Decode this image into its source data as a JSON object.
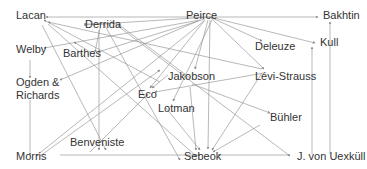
{
  "diagram": {
    "type": "directed-graph",
    "colors": {
      "edge": "#9a9a9a",
      "text": "#333333",
      "background": "#ffffff"
    },
    "nodes": [
      {
        "id": "lacan",
        "label": "Lacan",
        "x": 16,
        "y": 19,
        "ax": 46,
        "ay": 17
      },
      {
        "id": "derrida",
        "label": "Derrida",
        "x": 85,
        "y": 28,
        "ax": 84,
        "ay": 25
      },
      {
        "id": "peirce",
        "label": "Peirce",
        "x": 186,
        "y": 19,
        "ax": 210,
        "ay": 17
      },
      {
        "id": "bakhtin",
        "label": "Bakhtin",
        "x": 323,
        "y": 19,
        "ax": 320,
        "ay": 17
      },
      {
        "id": "welby",
        "label": "Welby",
        "x": 16,
        "y": 53,
        "ax": 44,
        "ay": 50
      },
      {
        "id": "barthes",
        "label": "Barthes",
        "x": 63,
        "y": 57,
        "ax": 98,
        "ay": 58
      },
      {
        "id": "deleuze",
        "label": "Deleuze",
        "x": 255,
        "y": 50,
        "ax": 262,
        "ay": 41
      },
      {
        "id": "kull",
        "label": "Kull",
        "x": 320,
        "y": 46,
        "ax": 317,
        "ay": 43
      },
      {
        "id": "ogden",
        "label": "Ogden &",
        "label2": "Richards",
        "x": 16,
        "y": 86,
        "ax": 60,
        "ay": 82
      },
      {
        "id": "jakobson",
        "label": "Jakobson",
        "x": 168,
        "y": 80,
        "ax": 195,
        "ay": 70
      },
      {
        "id": "levistrauss",
        "label": "Lévi-Strauss",
        "x": 255,
        "y": 80,
        "ax": 264,
        "ay": 70
      },
      {
        "id": "eco",
        "label": "Eco",
        "x": 138,
        "y": 98,
        "ax": 150,
        "ay": 90
      },
      {
        "id": "lotman",
        "label": "Lotman",
        "x": 158,
        "y": 112,
        "ax": 173,
        "ay": 102
      },
      {
        "id": "buhler",
        "label": "Bühler",
        "x": 270,
        "y": 121,
        "ax": 270,
        "ay": 113
      },
      {
        "id": "benveniste",
        "label": "Benveniste",
        "x": 70,
        "y": 146,
        "ax": 84,
        "ay": 137
      },
      {
        "id": "morris",
        "label": "Morris",
        "x": 16,
        "y": 160,
        "ax": 44,
        "ay": 157
      },
      {
        "id": "sebeok",
        "label": "Sebeok",
        "x": 184,
        "y": 160,
        "ax": 205,
        "ay": 150
      },
      {
        "id": "uexkull",
        "label": "J. von Uexküll",
        "x": 297,
        "y": 160,
        "ax": 295,
        "ay": 157
      }
    ],
    "edges": [
      {
        "from": [
          210,
          17
        ],
        "to": [
          46,
          17
        ]
      },
      {
        "from": [
          210,
          17
        ],
        "to": [
          84,
          25
        ]
      },
      {
        "from": [
          210,
          17
        ],
        "to": [
          318,
          17
        ]
      },
      {
        "from": [
          210,
          17
        ],
        "to": [
          315,
          43
        ]
      },
      {
        "from": [
          210,
          17
        ],
        "to": [
          262,
          41
        ]
      },
      {
        "from": [
          210,
          17
        ],
        "to": [
          264,
          69
        ]
      },
      {
        "from": [
          205,
          19
        ],
        "to": [
          98,
          52
        ]
      },
      {
        "from": [
          208,
          20
        ],
        "to": [
          195,
          69
        ]
      },
      {
        "from": [
          205,
          20
        ],
        "to": [
          150,
          88
        ]
      },
      {
        "from": [
          212,
          20
        ],
        "to": [
          173,
          101
        ]
      },
      {
        "from": [
          210,
          20
        ],
        "to": [
          208,
          149
        ]
      },
      {
        "from": [
          200,
          20
        ],
        "to": [
          44,
          48
        ]
      },
      {
        "from": [
          198,
          21
        ],
        "to": [
          60,
          80
        ]
      },
      {
        "from": [
          204,
          21
        ],
        "to": [
          36,
          156
        ]
      },
      {
        "from": [
          262,
          69
        ],
        "to": [
          48,
          22
        ]
      },
      {
        "from": [
          264,
          73
        ],
        "to": [
          155,
          92
        ]
      },
      {
        "from": [
          262,
          73
        ],
        "to": [
          212,
          150
        ]
      },
      {
        "from": [
          190,
          78
        ],
        "to": [
          118,
          24
        ]
      },
      {
        "from": [
          192,
          84
        ],
        "to": [
          270,
          113
        ]
      },
      {
        "from": [
          160,
          82
        ],
        "to": [
          44,
          20
        ]
      },
      {
        "from": [
          42,
          25
        ],
        "to": [
          106,
          150
        ]
      },
      {
        "from": [
          99,
          30
        ],
        "to": [
          99,
          150
        ]
      },
      {
        "from": [
          110,
          20
        ],
        "to": [
          290,
          156
        ]
      },
      {
        "from": [
          95,
          55
        ],
        "to": [
          74,
          42
        ]
      },
      {
        "from": [
          100,
          28
        ],
        "to": [
          95,
          52
        ]
      },
      {
        "from": [
          30,
          60
        ],
        "to": [
          30,
          78
        ]
      },
      {
        "from": [
          30,
          100
        ],
        "to": [
          30,
          155
        ]
      },
      {
        "from": [
          168,
          75
        ],
        "to": [
          152,
          88
        ]
      },
      {
        "from": [
          90,
          152
        ],
        "to": [
          148,
          94
        ]
      },
      {
        "from": [
          40,
          156
        ],
        "to": [
          160,
          70
        ]
      },
      {
        "from": [
          166,
          108
        ],
        "to": [
          200,
          150
        ]
      },
      {
        "from": [
          190,
          87
        ],
        "to": [
          196,
          150
        ]
      },
      {
        "from": [
          260,
          125
        ],
        "to": [
          213,
          152
        ]
      },
      {
        "from": [
          60,
          155
        ],
        "to": [
          200,
          155
        ]
      },
      {
        "from": [
          290,
          155
        ],
        "to": [
          218,
          155
        ]
      },
      {
        "from": [
          312,
          154
        ],
        "to": [
          312,
          47
        ]
      },
      {
        "from": [
          330,
          154
        ],
        "to": [
          330,
          22
        ]
      },
      {
        "from": [
          110,
          24
        ],
        "to": [
          84,
          24
        ]
      },
      {
        "from": [
          104,
          24
        ],
        "to": [
          180,
          160
        ]
      },
      {
        "from": [
          48,
          24
        ],
        "to": [
          196,
          156
        ]
      }
    ]
  }
}
